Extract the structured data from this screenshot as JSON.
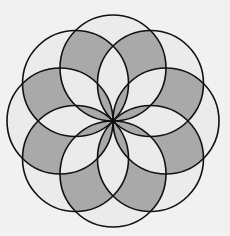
{
  "diagram": {
    "title": "",
    "circle_count": 8,
    "center": [
      113,
      121
    ],
    "radius": 53,
    "colors": {
      "background": "#f1f1f1",
      "shade": "#a9a9a9",
      "light": "#ebebeb",
      "stroke": "#111111"
    }
  }
}
